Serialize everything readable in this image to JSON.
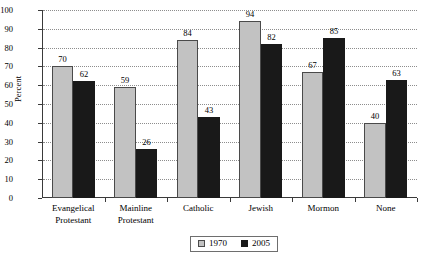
{
  "chart_data": {
    "type": "bar",
    "title": "",
    "xlabel": "",
    "ylabel": "Percent",
    "ylim": [
      0,
      100
    ],
    "ytick_step": 10,
    "yticks": [
      0,
      10,
      20,
      30,
      40,
      50,
      60,
      70,
      80,
      90,
      100
    ],
    "grid": true,
    "legend_position": "bottom-center",
    "categories": [
      "Evangelical Protestant",
      "Mainline Protestant",
      "Catholic",
      "Jewish",
      "Mormon",
      "None"
    ],
    "category_lines": [
      [
        "Evangelical",
        "Protestant"
      ],
      [
        "Mainline",
        "Protestant"
      ],
      [
        "Catholic"
      ],
      [
        "Jewish"
      ],
      [
        "Mormon"
      ],
      [
        "None"
      ]
    ],
    "series": [
      {
        "name": "1970",
        "color": "#c2c2c2",
        "values": [
          70,
          59,
          84,
          94,
          67,
          40
        ]
      },
      {
        "name": "2005",
        "color": "#191919",
        "values": [
          62,
          26,
          43,
          82,
          85,
          63
        ]
      }
    ]
  },
  "legend": {
    "items": [
      {
        "label": "1970",
        "swatch": "gray-square-icon"
      },
      {
        "label": "2005",
        "swatch": "black-square-icon"
      }
    ]
  }
}
